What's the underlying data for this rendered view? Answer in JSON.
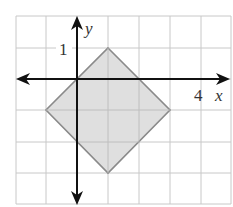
{
  "figure": {
    "type": "coordinate-grid",
    "grid": {
      "x_min": -2,
      "x_max": 5,
      "y_min": -4,
      "y_max": 2,
      "cell_px": 31,
      "color": "#c8c8c8"
    },
    "axes": {
      "x_label": "x",
      "y_label": "y",
      "x_tick_label": "4",
      "y_tick_label": "1",
      "color": "#111111"
    },
    "shape": {
      "name": "square (rotated 45°)",
      "vertices": [
        [
          1,
          1
        ],
        [
          3,
          -1
        ],
        [
          1,
          -3
        ],
        [
          -1,
          -1
        ]
      ],
      "fill": "#dcdcdc",
      "stroke": "#8a8a8a"
    }
  }
}
